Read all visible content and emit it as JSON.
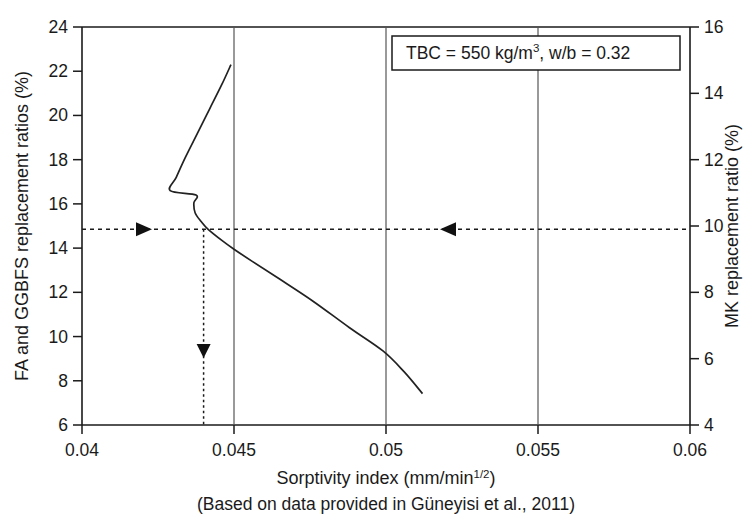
{
  "chart_data": {
    "type": "line",
    "title": "",
    "xlabel": "Sorptivity index (mm/min",
    "xlabel_sup": "1/2",
    "xlabel_tail": ")",
    "ylabel_left": "FA and GGBFS replacement ratios (%)",
    "ylabel_right": "MK replacement ratio (%)",
    "caption": "(Based on data provided in Güneyisi et al., 2011)",
    "xlim": [
      0.04,
      0.06
    ],
    "ylim_left": [
      6,
      24
    ],
    "ylim_right": [
      4,
      16
    ],
    "xticks": [
      "0.04",
      "0.045",
      "0.05",
      "0.055",
      "0.06"
    ],
    "xtick_values": [
      0.04,
      0.045,
      0.05,
      0.055,
      0.06
    ],
    "yticks_left": [
      "24",
      "22",
      "20",
      "18",
      "16",
      "14",
      "12",
      "10",
      "8",
      "6"
    ],
    "ytick_left_values": [
      24,
      22,
      20,
      18,
      16,
      14,
      12,
      10,
      8,
      6
    ],
    "yticks_right": [
      "16",
      "14",
      "12",
      "10",
      "8",
      "6",
      "4"
    ],
    "ytick_right_values": [
      16,
      14,
      12,
      10,
      8,
      6,
      4
    ],
    "grid": "vertical-only",
    "gridline_x_values": [
      0.045,
      0.05,
      0.055
    ],
    "legend": "none",
    "series": [
      {
        "name": "Sorptivity vs replacement ratio",
        "points": [
          [
            0.0449,
            22.3
          ],
          [
            0.0446,
            21.4
          ],
          [
            0.0442,
            20.3
          ],
          [
            0.0438,
            19.2
          ],
          [
            0.0434,
            18.1
          ],
          [
            0.0431,
            17.2
          ],
          [
            0.0429,
            16.6
          ],
          [
            0.04375,
            16.4
          ],
          [
            0.04368,
            16.05
          ],
          [
            0.04372,
            15.6
          ],
          [
            0.04392,
            15.2
          ],
          [
            0.04415,
            14.85
          ],
          [
            0.0446,
            14.35
          ],
          [
            0.045,
            13.95
          ],
          [
            0.0456,
            13.4
          ],
          [
            0.0465,
            12.6
          ],
          [
            0.0476,
            11.6
          ],
          [
            0.0488,
            10.4
          ],
          [
            0.0499,
            9.35
          ],
          [
            0.0506,
            8.4
          ],
          [
            0.0512,
            7.42
          ]
        ]
      }
    ],
    "annotations": {
      "box_text_a": "TBC = 550 kg/m",
      "box_text_sup": "3",
      "box_text_b": ", w/b = 0.32",
      "guide_horizontal_left_value": 14.85,
      "guide_horizontal_right_value": 10.0,
      "guide_vertical_value": 0.044,
      "arrow_right_label": "right-arrow",
      "arrow_left_label": "left-arrow",
      "arrow_down_label": "down-arrow"
    }
  },
  "colors": {
    "axis": "#1a1a1a",
    "curve": "#222222",
    "grid": "#555555",
    "background": "#ffffff"
  }
}
